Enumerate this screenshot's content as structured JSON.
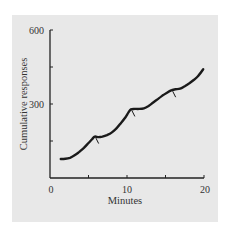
{
  "chart_data": {
    "type": "line",
    "title": "",
    "xlabel": "Minutes",
    "ylabel": "Cumulative responses",
    "xlim": [
      0,
      20
    ],
    "ylim": [
      0,
      600
    ],
    "x_ticks": [
      0,
      5,
      10,
      15,
      20
    ],
    "x_tick_labels": [
      "0",
      "10",
      "20"
    ],
    "y_ticks": [
      0,
      150,
      300,
      450,
      600
    ],
    "y_tick_labels": [
      "300",
      "600"
    ],
    "grid": false,
    "legend": null,
    "series": [
      {
        "name": "Cumulative responses",
        "x": [
          1.4,
          2.0,
          2.6,
          3.2,
          3.8,
          4.4,
          5.0,
          5.5,
          5.8,
          6.3,
          6.8,
          7.4,
          8.0,
          8.6,
          9.2,
          9.8,
          10.2,
          10.5,
          11.0,
          11.6,
          12.2,
          12.8,
          13.4,
          14.0,
          14.6,
          15.2,
          15.8,
          16.3,
          16.9,
          17.5,
          18.1,
          18.7,
          19.3,
          19.9
        ],
        "y": [
          77,
          78,
          82,
          92,
          106,
          122,
          142,
          158,
          168,
          166,
          168,
          174,
          184,
          200,
          222,
          246,
          266,
          278,
          280,
          280,
          282,
          292,
          306,
          320,
          334,
          346,
          356,
          360,
          362,
          372,
          384,
          398,
          416,
          441
        ]
      }
    ],
    "annotations": [
      {
        "type": "reinforcement-mark",
        "x": 5.8,
        "y": 168
      },
      {
        "type": "reinforcement-mark",
        "x": 10.5,
        "y": 278
      },
      {
        "type": "reinforcement-mark",
        "x": 15.8,
        "y": 356
      }
    ]
  },
  "labels": {
    "x_axis_title": "Minutes",
    "y_axis_title": "Cumulative responses",
    "x_tick_0": "0",
    "x_tick_10": "10",
    "x_tick_20": "20",
    "y_tick_300": "300",
    "y_tick_600": "600"
  },
  "colors": {
    "panel_bg": "#e8e8e8",
    "line": "#1a1a1a",
    "axis": "#222222"
  }
}
